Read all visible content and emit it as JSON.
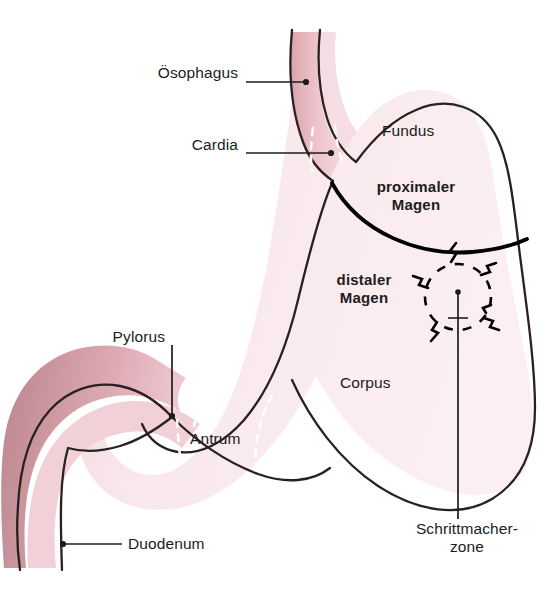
{
  "figure": {
    "kind": "anatomical-diagram",
    "language": "de",
    "background_color": "#ffffff"
  },
  "colors": {
    "outline": "#2b2020",
    "divider_line": "#000000",
    "leader_line": "#1c1c1c",
    "text": "#1c1c1c",
    "lumen_light_pink": "#f6dfe5",
    "lumen_pale_pink": "#fbeef1",
    "wall_mid_pink": "#eec0c8",
    "wall_dark_pink": "#d49ea6",
    "wall_deep_mauve": "#c08f97",
    "esophagus_inner": "#f2cfd6",
    "mucosa_dash": "#ffffff",
    "pacemaker_dash": "#000000"
  },
  "leader_labels": [
    {
      "id": "oesophagus",
      "text": "Ösophagus",
      "align": "right",
      "text_x": 78,
      "text_y": 74,
      "text_w": 160,
      "line": {
        "x1": 246,
        "y1": 82,
        "x2": 306,
        "y2": 82
      },
      "dot": {
        "cx": 306,
        "cy": 82,
        "r": 3.1
      }
    },
    {
      "id": "cardia",
      "text": "Cardia",
      "align": "right",
      "text_x": 78,
      "text_y": 145,
      "text_w": 160,
      "line": {
        "x1": 246,
        "y1": 153,
        "x2": 331,
        "y2": 153
      },
      "dot": {
        "cx": 331,
        "cy": 153,
        "r": 3.1
      }
    },
    {
      "id": "pylorus",
      "text": "Pylorus",
      "align": "right",
      "text_x": 40,
      "text_y": 336,
      "text_w": 125,
      "line": {
        "x1": 172,
        "y1": 345,
        "x2": 172,
        "y2": 416
      },
      "dot": {
        "cx": 172,
        "cy": 416,
        "r": 3.1
      }
    },
    {
      "id": "duodenum",
      "text": "Duodenum",
      "align": "left",
      "text_x": 128,
      "text_y": 536,
      "text_w": 160,
      "line": {
        "x1": 62,
        "y1": 544,
        "x2": 122,
        "y2": 544
      },
      "dot": {
        "cx": 62,
        "cy": 544,
        "r": 3.1
      }
    },
    {
      "id": "schrittmacherzone",
      "text": "Schrittmacher-\nzone",
      "line1": "Schrittmacher-",
      "line2": "zone",
      "align": "center",
      "text_x": 392,
      "text_y": 524,
      "text_w": 135,
      "line": {
        "x1": 458,
        "y1": 291,
        "x2": 458,
        "y2": 519
      },
      "dot": {
        "cx": 458,
        "cy": 291,
        "r": 2.8
      }
    }
  ],
  "region_labels": [
    {
      "id": "fundus",
      "text": "Fundus",
      "bold": false,
      "x": 382,
      "y": 130,
      "w": 90
    },
    {
      "id": "corpus",
      "text": "Corpus",
      "bold": false,
      "x": 340,
      "y": 382,
      "w": 90
    },
    {
      "id": "antrum",
      "text": "Antrum",
      "bold": false,
      "x": 190,
      "y": 438,
      "w": 90
    }
  ],
  "region_labels_bold": [
    {
      "id": "proximaler-magen",
      "line1": "proximaler",
      "line2": "Magen",
      "x": 352,
      "y": 185,
      "w": 118
    },
    {
      "id": "distaler-magen",
      "line1": "distaler",
      "line2": "Magen",
      "x": 313,
      "y": 278,
      "w": 100
    }
  ],
  "pacemaker_zone": {
    "center_x": 458,
    "center_y": 297,
    "radius": 33,
    "dash_pattern": "9 9",
    "bolt_count": 6,
    "bolt_angles_deg": [
      255,
      305,
      352,
      40,
      90,
      160
    ]
  },
  "divider": {
    "label": "proximaler/distaler Magen Grenze",
    "path": "M 332 183 C 360 232, 420 254, 472 250 C 497 248, 512 244, 524 239",
    "stroke_width": 3.6
  },
  "mucosa_dashes": [
    {
      "id": "cardia-dash",
      "path": "M 333 130 C 334 142, 336 152, 338 163"
    },
    {
      "id": "lesser-curve-dash",
      "path": "M 272 398 C 262 412, 256 432, 256 462 C 256 487, 258 503, 262 516"
    },
    {
      "id": "antrum-dash",
      "path": "M 176 418 C 177 434, 178 448, 180 462"
    },
    {
      "id": "greater-dash",
      "path": "M 314 130 C 311 146, 310 160, 311 172"
    }
  ]
}
